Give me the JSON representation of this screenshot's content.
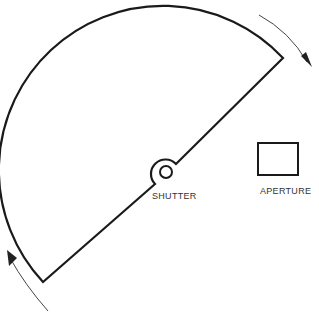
{
  "diagram": {
    "labels": {
      "shutter": "SHUTTER",
      "aperture": "APERTURE"
    },
    "elements": [
      {
        "id": "shutter-blade",
        "shape": "semicircle",
        "description": "semicircular shutter blade with hub"
      },
      {
        "id": "aperture",
        "shape": "rectangle"
      },
      {
        "id": "rotation-arrow-top",
        "direction": "clockwise"
      },
      {
        "id": "rotation-arrow-bottom",
        "direction": "clockwise"
      }
    ],
    "colors": {
      "stroke": "#1a1a1a",
      "arrow": "#444444",
      "text": "#333333"
    }
  }
}
